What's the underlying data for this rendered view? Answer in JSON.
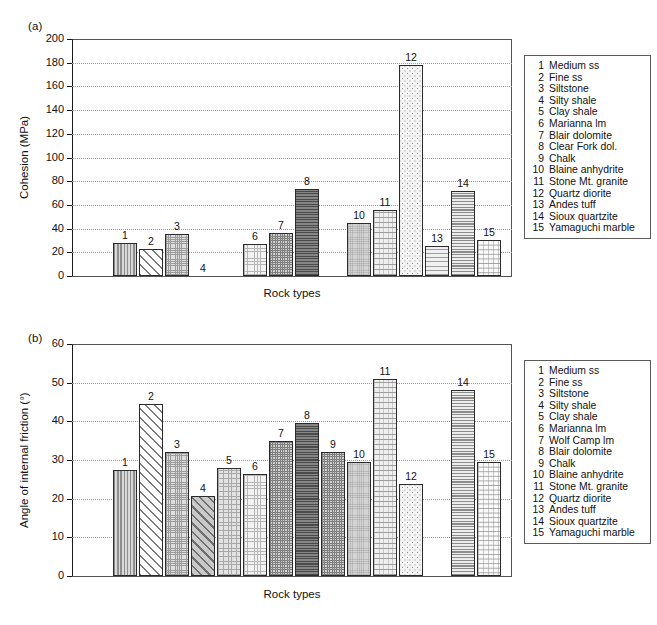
{
  "figure": {
    "panel_a_label": "(a)",
    "panel_b_label": "(b)"
  },
  "chart_data": [
    {
      "type": "bar",
      "panel": "(a)",
      "title": "",
      "xlabel": "Rock types",
      "ylabel": "Cohesion (MPa)",
      "ylim": [
        0,
        200
      ],
      "ytick_labels": [
        "0",
        "20",
        "40",
        "60",
        "80",
        "100",
        "120",
        "140",
        "160",
        "180",
        "200"
      ],
      "ytick_values": [
        0,
        20,
        40,
        60,
        80,
        100,
        120,
        140,
        160,
        180,
        200
      ],
      "grid": true,
      "legend_position": "right",
      "point_labels": [
        "1",
        "2",
        "3",
        "4",
        "6",
        "7",
        "8",
        "10",
        "11",
        "12",
        "13",
        "14",
        "15"
      ],
      "categories": [
        "1",
        "2",
        "3",
        "4",
        "6",
        "7",
        "8",
        "10",
        "11",
        "12",
        "13",
        "14",
        "15"
      ],
      "values": [
        27.5,
        23.0,
        35.5,
        0,
        27.0,
        36.5,
        73.0,
        44.5,
        56.0,
        178.0,
        25.5,
        72.0,
        30.5
      ],
      "bars": [
        {
          "id": "1",
          "label": "1",
          "value": 27.5,
          "pattern": "pat-vstripe"
        },
        {
          "id": "2",
          "label": "2",
          "value": 23.0,
          "pattern": "pat-diag"
        },
        {
          "id": "3",
          "label": "3",
          "value": 35.5,
          "pattern": "pat-fine-grid"
        },
        {
          "id": "4",
          "label": "4",
          "value": 0,
          "pattern": "pat-diag-grey"
        },
        {
          "id": "6",
          "label": "6",
          "value": 27.0,
          "pattern": "pat-dot-light"
        },
        {
          "id": "7",
          "label": "7",
          "value": 36.5,
          "pattern": "pat-cross-med"
        },
        {
          "id": "8",
          "label": "8",
          "value": 73.0,
          "pattern": "pat-dark-grid"
        },
        {
          "id": "10",
          "label": "10",
          "value": 44.5,
          "pattern": "pat-solid-grey"
        },
        {
          "id": "11",
          "label": "11",
          "value": 56.0,
          "pattern": "pat-dash"
        },
        {
          "id": "12",
          "label": "12",
          "value": 178.0,
          "pattern": "pat-sparse-dot"
        },
        {
          "id": "13",
          "label": "13",
          "value": 25.5,
          "pattern": "pat-wave"
        },
        {
          "id": "14",
          "label": "14",
          "value": 72.0,
          "pattern": "pat-hstripe"
        },
        {
          "id": "15",
          "label": "15",
          "value": 30.5,
          "pattern": "pat-chevron"
        }
      ],
      "legend_items": [
        {
          "num": "1",
          "name": "Medium ss"
        },
        {
          "num": "2",
          "name": "Fine ss"
        },
        {
          "num": "3",
          "name": "Siltstone"
        },
        {
          "num": "4",
          "name": "Silty shale"
        },
        {
          "num": "5",
          "name": "Clay shale"
        },
        {
          "num": "6",
          "name": "Marianna lm"
        },
        {
          "num": "7",
          "name": "Blair dolomite"
        },
        {
          "num": "8",
          "name": "Clear Fork dol."
        },
        {
          "num": "9",
          "name": "Chalk"
        },
        {
          "num": "10",
          "name": "Blaine anhydrite"
        },
        {
          "num": "11",
          "name": "Stone Mt. granite"
        },
        {
          "num": "12",
          "name": "Quartz diorite"
        },
        {
          "num": "13",
          "name": "Andes tuff"
        },
        {
          "num": "14",
          "name": "Sioux quartzite"
        },
        {
          "num": "15",
          "name": "Yamaguchi marble"
        }
      ]
    },
    {
      "type": "bar",
      "panel": "(b)",
      "title": "",
      "xlabel": "Rock types",
      "ylabel": "Angle of internal friction (°)",
      "ylim": [
        0,
        60
      ],
      "ytick_labels": [
        "0",
        "10",
        "20",
        "30",
        "40",
        "50",
        "60"
      ],
      "ytick_values": [
        0,
        10,
        20,
        30,
        40,
        50,
        60
      ],
      "grid": true,
      "legend_position": "right",
      "point_labels": [
        "1",
        "2",
        "3",
        "4",
        "5",
        "6",
        "7",
        "8",
        "9",
        "10",
        "11",
        "12",
        "14",
        "15"
      ],
      "categories": [
        "1",
        "2",
        "3",
        "4",
        "5",
        "6",
        "7",
        "8",
        "9",
        "10",
        "11",
        "12",
        "14",
        "15"
      ],
      "values": [
        27.5,
        44.5,
        32.0,
        20.7,
        28.0,
        26.5,
        35.0,
        39.5,
        32.0,
        29.5,
        51.0,
        23.7,
        48.0,
        29.5
      ],
      "bars": [
        {
          "id": "1",
          "label": "1",
          "value": 27.5,
          "pattern": "pat-vstripe"
        },
        {
          "id": "2",
          "label": "2",
          "value": 44.5,
          "pattern": "pat-diag"
        },
        {
          "id": "3",
          "label": "3",
          "value": 32.0,
          "pattern": "pat-fine-grid"
        },
        {
          "id": "4",
          "label": "4",
          "value": 20.7,
          "pattern": "pat-diag-grey"
        },
        {
          "id": "5",
          "label": "5",
          "value": 28.0,
          "pattern": "pat-speckle"
        },
        {
          "id": "6",
          "label": "6",
          "value": 26.5,
          "pattern": "pat-dot-light"
        },
        {
          "id": "7",
          "label": "7",
          "value": 35.0,
          "pattern": "pat-cross-med"
        },
        {
          "id": "8",
          "label": "8",
          "value": 39.5,
          "pattern": "pat-dark-grid"
        },
        {
          "id": "9",
          "label": "9",
          "value": 32.0,
          "pattern": "pat-cross-med"
        },
        {
          "id": "10",
          "label": "10",
          "value": 29.5,
          "pattern": "pat-solid-grey"
        },
        {
          "id": "11",
          "label": "11",
          "value": 51.0,
          "pattern": "pat-dash"
        },
        {
          "id": "12",
          "label": "12",
          "value": 23.7,
          "pattern": "pat-sparse-dot"
        },
        {
          "id": "14",
          "label": "14",
          "value": 48.0,
          "pattern": "pat-hstripe"
        },
        {
          "id": "15",
          "label": "15",
          "value": 29.5,
          "pattern": "pat-chevron"
        }
      ],
      "legend_items": [
        {
          "num": "1",
          "name": "Medium ss"
        },
        {
          "num": "2",
          "name": "Fine ss"
        },
        {
          "num": "3",
          "name": "Siltstone"
        },
        {
          "num": "4",
          "name": "Silty shale"
        },
        {
          "num": "5",
          "name": "Clay shale"
        },
        {
          "num": "6",
          "name": "Marianna lm"
        },
        {
          "num": "7",
          "name": "Wolf Camp lm"
        },
        {
          "num": "8",
          "name": "Blair dolomite"
        },
        {
          "num": "9",
          "name": "Chalk"
        },
        {
          "num": "10",
          "name": "Blaine anhydrite"
        },
        {
          "num": "11",
          "name": "Stone Mt. granite"
        },
        {
          "num": "12",
          "name": "Quartz diorite"
        },
        {
          "num": "13",
          "name": "Andes tuff"
        },
        {
          "num": "14",
          "name": "Sioux quartzite"
        },
        {
          "num": "15",
          "name": "Yamaguchi marble"
        }
      ]
    }
  ]
}
